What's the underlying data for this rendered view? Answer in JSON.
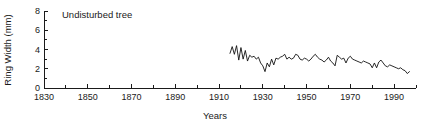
{
  "chart_data": {
    "type": "line",
    "title": "",
    "annotation": "Undisturbed tree",
    "xlabel": "Years",
    "ylabel": "Ring Width (mm)",
    "xlim": [
      1830,
      2000
    ],
    "ylim": [
      0,
      8
    ],
    "x_major_ticks": [
      1830,
      1850,
      1870,
      1890,
      1910,
      1930,
      1950,
      1970,
      1990
    ],
    "x_major_tick_labels": [
      "1830",
      "1850",
      "1870",
      "1890",
      "1910",
      "1930",
      "1950",
      "1970",
      "1990"
    ],
    "x_minor_tick_interval": 10,
    "y_major_ticks": [
      0,
      2,
      4,
      6,
      8
    ],
    "y_major_tick_labels": [
      "0",
      "2",
      "4",
      "6",
      "8"
    ],
    "y_minor_tick_interval": 1,
    "grid": false,
    "legend": false,
    "line_color": "#111111",
    "series": [
      {
        "name": "Ring width",
        "x": [
          1915,
          1916,
          1917,
          1918,
          1919,
          1920,
          1921,
          1922,
          1923,
          1924,
          1925,
          1926,
          1927,
          1928,
          1929,
          1930,
          1931,
          1932,
          1933,
          1934,
          1935,
          1936,
          1937,
          1938,
          1939,
          1940,
          1941,
          1942,
          1943,
          1944,
          1945,
          1946,
          1947,
          1948,
          1949,
          1950,
          1951,
          1952,
          1953,
          1954,
          1955,
          1956,
          1957,
          1958,
          1959,
          1960,
          1961,
          1962,
          1963,
          1964,
          1965,
          1966,
          1967,
          1968,
          1969,
          1970,
          1971,
          1972,
          1973,
          1974,
          1975,
          1976,
          1977,
          1978,
          1979,
          1980,
          1981,
          1982,
          1983,
          1984,
          1985,
          1986,
          1987,
          1988,
          1989,
          1990,
          1991,
          1992,
          1993,
          1994,
          1995,
          1996,
          1997
        ],
        "values": [
          3.6,
          4.3,
          3.5,
          4.4,
          2.9,
          4.2,
          3.0,
          3.9,
          2.8,
          3.4,
          3.2,
          3.3,
          3.0,
          3.2,
          2.6,
          2.3,
          1.7,
          2.6,
          2.2,
          3.0,
          2.4,
          3.1,
          3.0,
          3.2,
          3.3,
          3.5,
          3.0,
          3.2,
          3.0,
          3.1,
          3.5,
          3.4,
          3.0,
          2.9,
          3.1,
          3.0,
          2.8,
          3.0,
          3.3,
          3.5,
          3.2,
          3.0,
          2.9,
          2.7,
          2.9,
          3.2,
          2.8,
          2.6,
          2.3,
          3.4,
          3.2,
          3.0,
          3.1,
          2.6,
          3.1,
          3.3,
          3.0,
          2.9,
          2.8,
          2.7,
          2.6,
          2.8,
          2.7,
          2.6,
          2.5,
          2.1,
          2.6,
          2.1,
          2.7,
          2.9,
          2.6,
          2.3,
          2.2,
          2.4,
          2.3,
          2.2,
          2.1,
          2.0,
          2.1,
          1.9,
          1.8,
          1.5,
          1.7
        ]
      }
    ]
  }
}
